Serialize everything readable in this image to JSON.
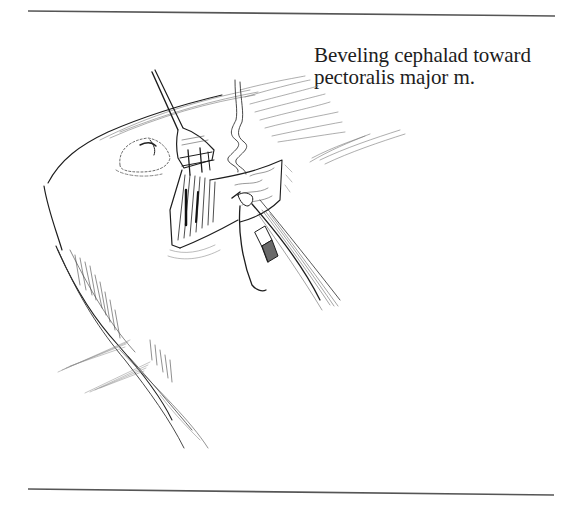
{
  "figure": {
    "caption": {
      "line1": "Beveling cephalad toward",
      "line2": "pectoralis major m."
    },
    "illustration": {
      "subject": "surgical-incision-chest-wall",
      "elements": [
        "retractor-fork",
        "electrocautery-pencil",
        "incision-wound",
        "smoke-wisp",
        "nipple-areola",
        "body-contour",
        "shading-strokes"
      ]
    },
    "rules": {
      "top": {
        "x1": 28,
        "y1": 11,
        "x2": 555,
        "y2": 16,
        "color": "#555555"
      },
      "bottom": {
        "x1": 28,
        "y1": 489,
        "x2": 554,
        "y2": 495,
        "color": "#555555"
      }
    },
    "colors": {
      "ink": "#1d1d1d",
      "rule": "#555555",
      "background": "#ffffff"
    }
  }
}
